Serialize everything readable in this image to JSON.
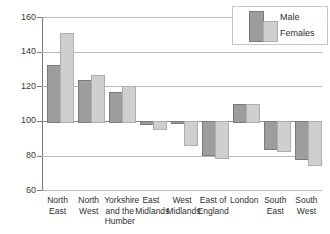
{
  "chart_data": {
    "type": "bar",
    "title": "",
    "subtitle": "",
    "xlabel": "",
    "ylabel": "",
    "ylim": [
      60,
      160
    ],
    "yticks": [
      60,
      80,
      100,
      120,
      140,
      160
    ],
    "grid": true,
    "baseline": 100,
    "legend_position": "top-right",
    "categories": [
      "North East",
      "North West",
      "Yorkshire and the Humber",
      "East Midlands",
      "West Midlands",
      "East of England",
      "London",
      "South East",
      "South West"
    ],
    "category_lines": [
      [
        "North",
        "East"
      ],
      [
        "North",
        "West"
      ],
      [
        "Yorkshire",
        "and the",
        "Humber"
      ],
      [
        "East",
        "Midlands"
      ],
      [
        "West",
        "Midlands"
      ],
      [
        "East of",
        "England"
      ],
      [
        "London"
      ],
      [
        "South",
        "East"
      ],
      [
        "South",
        "West"
      ]
    ],
    "series": [
      {
        "name": "Male",
        "color": "#9d9d9d",
        "values": [
          132,
          123.5,
          116.5,
          98.5,
          99.5,
          81,
          110,
          84,
          78.5
        ]
      },
      {
        "name": "Females",
        "color": "#cfcfcf",
        "values": [
          151,
          126.5,
          120,
          96,
          86.5,
          79,
          110,
          83,
          75
        ]
      }
    ]
  },
  "legend": {
    "male_label": "Male",
    "female_label": "Females"
  },
  "axis": {
    "y_tick_labels": [
      "160",
      "140",
      "120",
      "100",
      "80",
      "60"
    ]
  }
}
